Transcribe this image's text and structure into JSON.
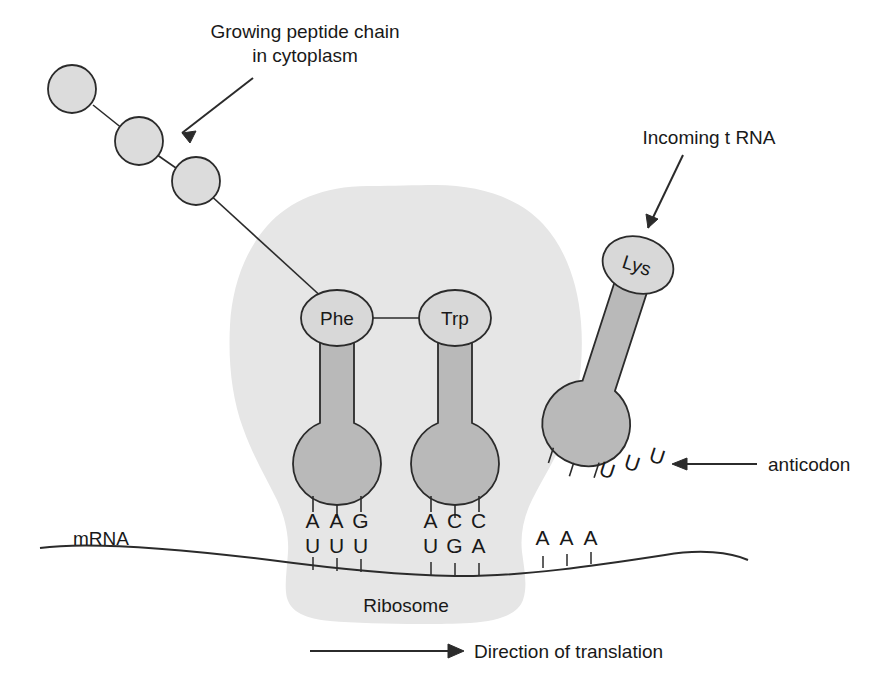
{
  "figure": {
    "background": "#ffffff"
  },
  "colors": {
    "ribosome_fill": "#e6e6e6",
    "trna_fill": "#b9b9b9",
    "peptide_fill": "#dcdcdc",
    "amino_acid_fill": "#d8d8d8",
    "outline": "#2b2b2b",
    "text": "#191919"
  },
  "annotations": {
    "growing_chain": {
      "line1": "Growing peptide chain",
      "line2": "in cytoplasm"
    },
    "incoming_trna": "Incoming t RNA",
    "anticodon": "anticodon",
    "ribosome": "Ribosome",
    "mrna": "mRNA",
    "direction": "Direction of translation"
  },
  "amino_acids": [
    {
      "name": "site-p",
      "label": "Phe"
    },
    {
      "name": "site-a",
      "label": "Trp"
    },
    {
      "name": "incoming",
      "label": "Lys"
    }
  ],
  "peptide_chain": {
    "residue_count": 3,
    "residues": [
      "",
      "",
      ""
    ]
  },
  "codons": [
    {
      "site": "P-site",
      "anticodon": [
        "A",
        "A",
        "G"
      ],
      "codon": [
        "U",
        "U",
        "U"
      ],
      "amino_acid": "Phe"
    },
    {
      "site": "A-site",
      "anticodon": [
        "A",
        "C",
        "C"
      ],
      "codon": [
        "U",
        "G",
        "A"
      ],
      "amino_acid": "Trp"
    }
  ],
  "mrna_next_codon": [
    "A",
    "A",
    "A"
  ],
  "incoming_anticodon": [
    "U",
    "U",
    "U"
  ]
}
